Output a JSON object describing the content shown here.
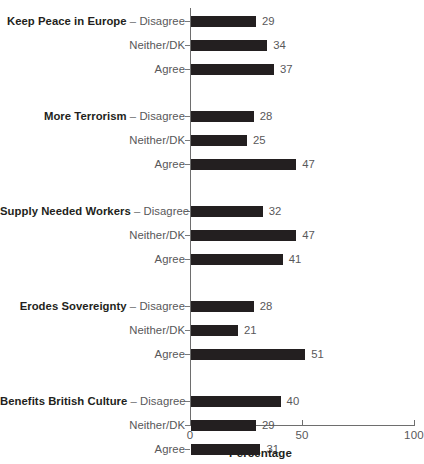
{
  "chart_data": {
    "type": "bar",
    "orientation": "horizontal",
    "title": "",
    "xlabel": "Percentage",
    "ylabel": "",
    "xlim": [
      0,
      100
    ],
    "xticks": [
      0,
      50,
      100
    ],
    "xticklabels": [
      "0",
      "50",
      "100"
    ],
    "grid": false,
    "legend": null,
    "bar_color": "#231f20",
    "axis_color": "#6e6e6e",
    "label_color": "#58585a",
    "groups": [
      {
        "name": "Keep Peace in Europe",
        "categories": [
          "Disagree",
          "Neither/DK",
          "Agree"
        ],
        "values": [
          29,
          34,
          37
        ]
      },
      {
        "name": "More Terrorism",
        "categories": [
          "Disagree",
          "Neither/DK",
          "Agree"
        ],
        "values": [
          28,
          25,
          47
        ]
      },
      {
        "name": "Supply Needed Workers",
        "categories": [
          "Disagree",
          "Neither/DK",
          "Agree"
        ],
        "values": [
          32,
          47,
          41
        ]
      },
      {
        "name": "Erodes Sovereignty",
        "categories": [
          "Disagree",
          "Neither/DK",
          "Agree"
        ],
        "values": [
          28,
          21,
          51
        ]
      },
      {
        "name": "Benefits British Culture",
        "categories": [
          "Disagree",
          "Neither/DK",
          "Agree"
        ],
        "values": [
          40,
          29,
          31
        ]
      }
    ]
  },
  "rows": [
    {
      "group": "Keep Peace in Europe",
      "dash": " – ",
      "category": "Disagree",
      "value": 29
    },
    {
      "group": "",
      "dash": "",
      "category": "Neither/DK",
      "value": 34
    },
    {
      "group": "",
      "dash": "",
      "category": "Agree",
      "value": 37
    },
    {
      "group": "More Terrorism",
      "dash": " – ",
      "category": "Disagree",
      "value": 28
    },
    {
      "group": "",
      "dash": "",
      "category": "Neither/DK",
      "value": 25
    },
    {
      "group": "",
      "dash": "",
      "category": "Agree",
      "value": 47
    },
    {
      "group": "Supply Needed Workers",
      "dash": " – ",
      "category": "Disagree",
      "value": 32
    },
    {
      "group": "",
      "dash": "",
      "category": "Neither/DK",
      "value": 47
    },
    {
      "group": "",
      "dash": "",
      "category": "Agree",
      "value": 41
    },
    {
      "group": "Erodes Sovereignty",
      "dash": " – ",
      "category": "Disagree",
      "value": 28
    },
    {
      "group": "",
      "dash": "",
      "category": "Neither/DK",
      "value": 21
    },
    {
      "group": "",
      "dash": "",
      "category": "Agree",
      "value": 51
    },
    {
      "group": "Benefits British Culture",
      "dash": " – ",
      "category": "Disagree",
      "value": 40
    },
    {
      "group": "",
      "dash": "",
      "category": "Neither/DK",
      "value": 29
    },
    {
      "group": "",
      "dash": "",
      "category": "Agree",
      "value": 31
    }
  ],
  "axis": {
    "x_title": "Percentage",
    "ticklabels": [
      "0",
      "50",
      "100"
    ]
  }
}
